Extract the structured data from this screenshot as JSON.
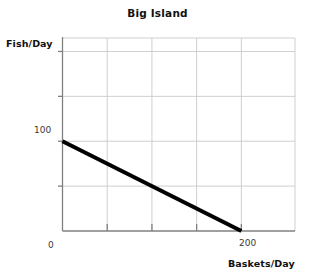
{
  "chart_data": {
    "type": "line",
    "title": "Big Island",
    "xlabel": "Baskets/Day",
    "ylabel": "Fish/Day",
    "xlim": [
      0,
      260
    ],
    "ylim": [
      0,
      215
    ],
    "grid": true,
    "legend": "none",
    "series": [
      {
        "name": "Production Possibilities Frontier",
        "x": [
          0,
          200
        ],
        "y": [
          100,
          0
        ],
        "color": "#000000",
        "line_width": 4
      }
    ],
    "x_ticks": [
      {
        "value": 0,
        "label": "0"
      },
      {
        "value": 50,
        "label": ""
      },
      {
        "value": 100,
        "label": ""
      },
      {
        "value": 150,
        "label": ""
      },
      {
        "value": 200,
        "label": "200"
      }
    ],
    "y_ticks": [
      {
        "value": 0,
        "label": ""
      },
      {
        "value": 50,
        "label": ""
      },
      {
        "value": 100,
        "label": "100"
      },
      {
        "value": 150,
        "label": ""
      },
      {
        "value": 200,
        "label": ""
      }
    ],
    "annotations": [],
    "colors": {
      "grid": "#c9c9c9",
      "axis": "#808080",
      "data_line": "#000000",
      "text": "#111111",
      "background": "#ffffff"
    }
  },
  "labels": {
    "title": "Big Island",
    "y_axis_title": "Fish/Day",
    "x_axis_title": "Baskets/Day",
    "y_tick_100": "100",
    "x_tick_0": "0",
    "x_tick_200": "200"
  }
}
